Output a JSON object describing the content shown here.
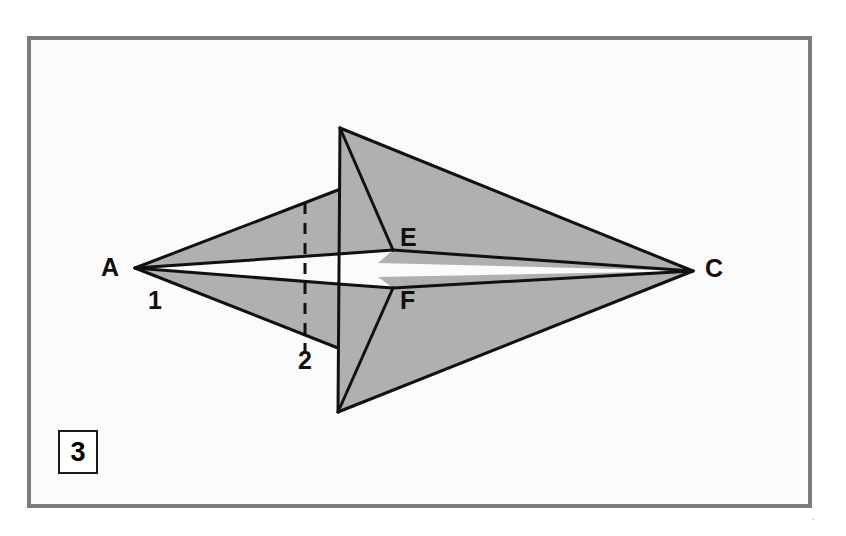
{
  "figure": {
    "step_number": "3",
    "caption_box_label": "3",
    "background_color": "#ffffff",
    "panel_color": "#fbfbfb",
    "frame_color": "#7b7b7b",
    "fill_color": "#b0b0b0",
    "stroke_color": "#111111",
    "labels": [
      {
        "id": "label-a",
        "text": "A",
        "x": 101,
        "y": 255
      },
      {
        "id": "label-c",
        "text": "C",
        "x": 705,
        "y": 256
      },
      {
        "id": "label-e",
        "text": "E",
        "x": 400,
        "y": 225
      },
      {
        "id": "label-f",
        "text": "F",
        "x": 400,
        "y": 288
      },
      {
        "id": "label-1",
        "text": "1",
        "x": 148,
        "y": 288
      },
      {
        "id": "label-2",
        "text": "2",
        "x": 298,
        "y": 348
      }
    ],
    "points": {
      "A": [
        135,
        268
      ],
      "C": [
        693,
        271
      ],
      "B_top": [
        340,
        128
      ],
      "D_bottom": [
        338,
        412
      ],
      "E": [
        393,
        250
      ],
      "F": [
        393,
        288
      ]
    },
    "dashed_fold_line": {
      "x": 305,
      "y1": 203,
      "y2": 352
    },
    "shapes": [
      {
        "name": "upper-left-flap",
        "fill": true,
        "points": "135,268 338,190 338,254"
      },
      {
        "name": "lower-left-flap",
        "fill": true,
        "points": "135,268 338,284 338,348"
      },
      {
        "name": "upper-center-panel",
        "fill": true,
        "points": "340,128 393,250 338,254 338,190"
      },
      {
        "name": "lower-center-panel",
        "fill": true,
        "points": "338,412 393,288 338,284 338,348"
      },
      {
        "name": "upper-right-flap",
        "fill": true,
        "points": "340,128 693,271 378,263 393,250"
      },
      {
        "name": "lower-right-flap",
        "fill": true,
        "points": "338,412 693,271 378,277 393,288"
      }
    ],
    "edges": [
      {
        "name": "a-to-upper-fold",
        "from": [
          135,
          268
        ],
        "to": [
          338,
          190
        ]
      },
      {
        "name": "a-to-lower-fold",
        "from": [
          135,
          268
        ],
        "to": [
          338,
          348
        ]
      },
      {
        "name": "a-to-upper-white",
        "from": [
          135,
          268
        ],
        "to": [
          338,
          254
        ]
      },
      {
        "name": "a-to-lower-white",
        "from": [
          135,
          268
        ],
        "to": [
          338,
          284
        ]
      },
      {
        "name": "top-vertical-crease",
        "from": [
          340,
          128
        ],
        "to": [
          338,
          412
        ]
      },
      {
        "name": "b-to-e",
        "from": [
          340,
          128
        ],
        "to": [
          393,
          250
        ]
      },
      {
        "name": "d-to-f",
        "from": [
          338,
          412
        ],
        "to": [
          393,
          288
        ]
      },
      {
        "name": "b-to-c",
        "from": [
          340,
          128
        ],
        "to": [
          693,
          271
        ]
      },
      {
        "name": "d-to-c",
        "from": [
          338,
          412
        ],
        "to": [
          693,
          271
        ]
      },
      {
        "name": "e-to-c",
        "from": [
          393,
          250
        ],
        "to": [
          693,
          271
        ]
      },
      {
        "name": "f-to-c",
        "from": [
          393,
          288
        ],
        "to": [
          693,
          271
        ]
      },
      {
        "name": "upper-white-top-edge",
        "from": [
          338,
          254
        ],
        "to": [
          393,
          250
        ]
      },
      {
        "name": "lower-white-bottom-edge",
        "from": [
          338,
          284
        ],
        "to": [
          393,
          288
        ]
      }
    ]
  }
}
